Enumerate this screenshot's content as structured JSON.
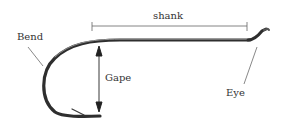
{
  "diagram": {
    "labels": {
      "shank": "shank",
      "bend": "Bend",
      "gape": "Gape",
      "eye": "Eye"
    },
    "colors": {
      "hook": "#3a3a3a",
      "hook_highlight": "#9a9a9a",
      "leader_lines": "#555555",
      "text": "#333333",
      "background": "#ffffff"
    }
  }
}
